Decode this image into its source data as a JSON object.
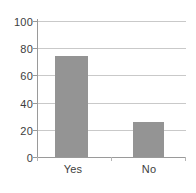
{
  "chart_data": {
    "type": "bar",
    "title": "",
    "subtitle": "",
    "xlabel": "",
    "ylabel": "",
    "categories": [
      "Yes",
      "No"
    ],
    "values": [
      74,
      26
    ],
    "ylim": [
      0,
      100
    ],
    "yticks": [
      0,
      20,
      40,
      60,
      80,
      100
    ],
    "ytick_labels": [
      "0",
      "20",
      "40",
      "60",
      "80",
      "100"
    ],
    "grid": true,
    "grid_axis": "y",
    "legend": false,
    "legend_position": "none",
    "annotations": [],
    "colors": {
      "bar_fill": "#949494",
      "gridline": "#c9c9c9",
      "axis_line": "#9a9a9a",
      "text": "#3d3d3d",
      "background": "#ffffff"
    }
  }
}
